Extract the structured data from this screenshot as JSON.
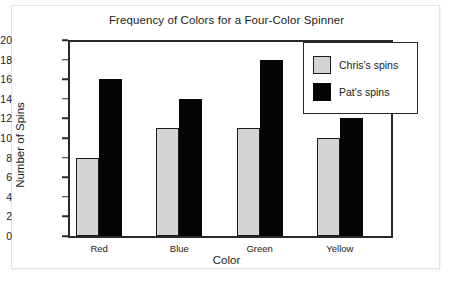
{
  "chart_data": {
    "type": "bar",
    "title": "Frequency of Colors for a Four-Color Spinner",
    "xlabel": "Color",
    "ylabel": "Number of Spins",
    "categories": [
      "Red",
      "Blue",
      "Green",
      "Yellow"
    ],
    "series": [
      {
        "name": "Chris's spins",
        "values": [
          8,
          11,
          11,
          10
        ],
        "color": "#d4d4d4"
      },
      {
        "name": "Pat's spins",
        "values": [
          16,
          14,
          18,
          12
        ],
        "color": "#050505"
      }
    ],
    "ylim": [
      0,
      20
    ],
    "ytick_step": 2,
    "yticks": [
      20,
      18,
      16,
      14,
      12,
      10,
      8,
      6,
      4,
      2,
      0
    ],
    "ytick_labels": [
      "20",
      "18",
      "16",
      "14",
      "12",
      "10",
      "8",
      "6",
      "4",
      "2",
      "0"
    ],
    "grid": false,
    "legend_position": "top-right",
    "axis_color": "#2a2a2a"
  }
}
